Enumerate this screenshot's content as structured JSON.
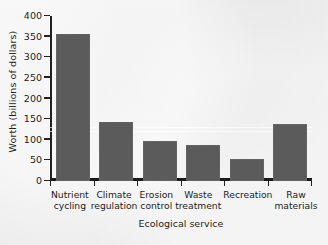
{
  "chart_data": {
    "type": "bar",
    "title": "",
    "xlabel": "Ecological service",
    "ylabel": "Worth (billions of dollars)",
    "categories": [
      "Nutrient cycling",
      "Climate regulation",
      "Erosion control",
      "Waste treatment",
      "Recreation",
      "Raw materials"
    ],
    "category_lines": [
      "Nutrient\ncycling",
      "Climate\nregulation",
      "Erosion\ncontrol",
      "Waste\ntreatment",
      "Recreation",
      "Raw\nmaterials"
    ],
    "values": [
      357,
      142,
      97,
      88,
      53,
      138
    ],
    "ylim": [
      0,
      400
    ],
    "yticks": [
      0,
      50,
      100,
      150,
      200,
      250,
      300,
      350,
      400
    ],
    "ytick_labels": [
      "0",
      "50",
      "100",
      "150",
      "200",
      "250",
      "300",
      "350",
      "400"
    ],
    "grid": false,
    "legend": null,
    "bar_color": "#5b5b5b",
    "axis_color": "#23211f",
    "background_color": "#eceded"
  }
}
